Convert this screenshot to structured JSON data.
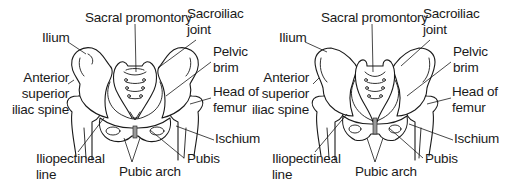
{
  "figure": {
    "panels": [
      {
        "id": "left",
        "description": "Pelvis (wide, rounded inlet)",
        "labels": {
          "sacral_promontory": "Sacral promontory",
          "sacroiliac_joint_1": "Sacroiliac",
          "sacroiliac_joint_2": "joint",
          "ilium": "Ilium",
          "pelvic_brim_1": "Pelvic",
          "pelvic_brim_2": "brim",
          "asis_1": "Anterior",
          "asis_2": "superior",
          "asis_3": "iliac spine",
          "head_of_femur_1": "Head of",
          "head_of_femur_2": "femur",
          "ischium": "Ischium",
          "iliopectineal_line_1": "Iliopectineal",
          "iliopectineal_line_2": "line",
          "pubic_arch": "Pubic arch",
          "pubis": "Pubis"
        }
      },
      {
        "id": "right",
        "description": "Pelvis (narrow, heart-shaped inlet)",
        "labels": {
          "sacral_promontory": "Sacral promontory",
          "sacroiliac_joint_1": "Sacroiliac",
          "sacroiliac_joint_2": "joint",
          "ilium": "Ilium",
          "pelvic_brim_1": "Pelvic",
          "pelvic_brim_2": "brim",
          "asis_1": "Anterior",
          "asis_2": "superior",
          "asis_3": "iliac spine",
          "head_of_femur_1": "Head of",
          "head_of_femur_2": "femur",
          "ischium": "Ischium",
          "iliopectineal_line_1": "Iliopectineal",
          "iliopectineal_line_2": "line",
          "pubic_arch": "Pubic arch",
          "pubis": "Pubis"
        }
      }
    ],
    "colors": {
      "line": "#1a1a1a",
      "background": "#ffffff",
      "symphysis_shade": "#9a9a9a"
    }
  }
}
